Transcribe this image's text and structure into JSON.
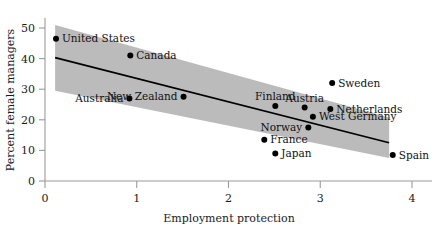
{
  "chart_data": {
    "type": "scatter",
    "title": "",
    "xlabel": "Employment protection",
    "ylabel": "Percent female managers",
    "xlim": [
      -0.1,
      4.3
    ],
    "ylim": [
      -2,
      53
    ],
    "xticks": [
      0,
      1,
      2,
      3,
      4
    ],
    "xtick_labels": [
      "0",
      "1",
      "2",
      "3",
      "4"
    ],
    "yticks": [
      0,
      10,
      20,
      30,
      40,
      50
    ],
    "ytick_labels": [
      "0",
      "10",
      "20",
      "30",
      "40",
      "50"
    ],
    "grid": false,
    "legend": "none",
    "point_label_color": "#111111",
    "band_color": "#b5b5b5",
    "line_color": "#000000",
    "dot_color": "#000000",
    "points": [
      {
        "label": "United States",
        "x": 0.12,
        "y": 46.5,
        "label_side": "right"
      },
      {
        "label": "Canada",
        "x": 0.93,
        "y": 41.0,
        "label_side": "right"
      },
      {
        "label": "Australia",
        "x": 0.92,
        "y": 27.0,
        "label_side": "left"
      },
      {
        "label": "New Zealand",
        "x": 1.51,
        "y": 27.5,
        "label_side": "left"
      },
      {
        "label": "Sweden",
        "x": 3.13,
        "y": 32.0,
        "label_side": "right"
      },
      {
        "label": "Finland",
        "x": 2.51,
        "y": 24.5,
        "label_side": "above"
      },
      {
        "label": "Austria",
        "x": 2.83,
        "y": 24.0,
        "label_side": "above"
      },
      {
        "label": "Netherlands",
        "x": 3.11,
        "y": 23.5,
        "label_side": "right"
      },
      {
        "label": "West Germany",
        "x": 2.92,
        "y": 21.0,
        "label_side": "right"
      },
      {
        "label": "Norway",
        "x": 2.87,
        "y": 17.5,
        "label_side": "left"
      },
      {
        "label": "France",
        "x": 2.39,
        "y": 13.5,
        "label_side": "right"
      },
      {
        "label": "Japan",
        "x": 2.51,
        "y": 9.0,
        "label_side": "right"
      },
      {
        "label": "Spain",
        "x": 3.79,
        "y": 8.5,
        "label_side": "right"
      }
    ],
    "fit_line": {
      "x_start": 0.11,
      "y_start": 40.3,
      "x_end": 3.75,
      "y_end": 12.5
    },
    "confidence_band": {
      "x_start": 0.11,
      "x_end": 3.75,
      "upper_start": 51.0,
      "upper_end": 20.8,
      "lower_start": 29.5,
      "lower_end": 7.5
    }
  }
}
